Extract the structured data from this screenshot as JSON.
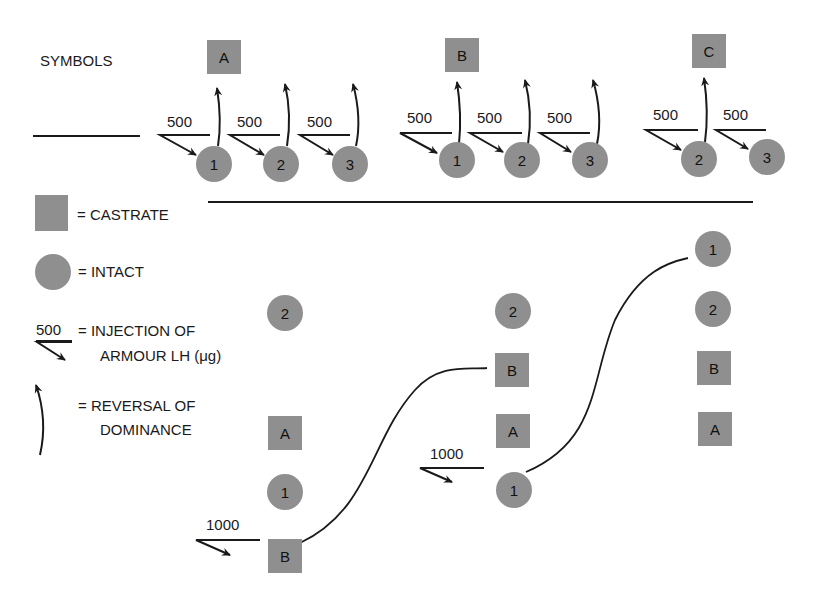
{
  "colors": {
    "shape_fill": "#8f8f8f",
    "ink": "#1a1a1a",
    "background": "#ffffff"
  },
  "legend": {
    "title": "SYMBOLS",
    "castrate": {
      "symbol": "square",
      "label": "= CASTRATE"
    },
    "intact": {
      "symbol": "circle",
      "label": "= INTACT"
    },
    "injection": {
      "symbol_value": "500",
      "label_line1": "= INJECTION OF",
      "label_line2": "ARMOUR LH (μg)"
    },
    "reversal": {
      "symbol": "curved-arrow",
      "label_line1": "= REVERSAL OF",
      "label_line2": "DOMINANCE"
    }
  },
  "top_groups": [
    {
      "castrate": "A",
      "intacts": [
        {
          "id": "1",
          "dose": "500"
        },
        {
          "id": "2",
          "dose": "500"
        },
        {
          "id": "3",
          "dose": "500"
        }
      ]
    },
    {
      "castrate": "B",
      "intacts": [
        {
          "id": "1",
          "dose": "500"
        },
        {
          "id": "2",
          "dose": "500"
        },
        {
          "id": "3",
          "dose": "500"
        }
      ]
    },
    {
      "castrate": "C",
      "intacts": [
        {
          "id": "2",
          "dose": "500"
        },
        {
          "id": "3",
          "dose": "500"
        }
      ]
    }
  ],
  "hierarchies": [
    {
      "stack": [
        "2",
        "A",
        "1",
        "B"
      ],
      "types": [
        "intact",
        "castrate",
        "intact",
        "castrate"
      ],
      "injection": {
        "target": "B",
        "dose": "1000"
      }
    },
    {
      "stack": [
        "2",
        "B",
        "A",
        "1"
      ],
      "types": [
        "intact",
        "castrate",
        "castrate",
        "intact"
      ],
      "injection": {
        "target": "1",
        "dose": "1000"
      }
    },
    {
      "stack": [
        "1",
        "2",
        "B",
        "A"
      ],
      "types": [
        "intact",
        "intact",
        "castrate",
        "castrate"
      ]
    }
  ]
}
